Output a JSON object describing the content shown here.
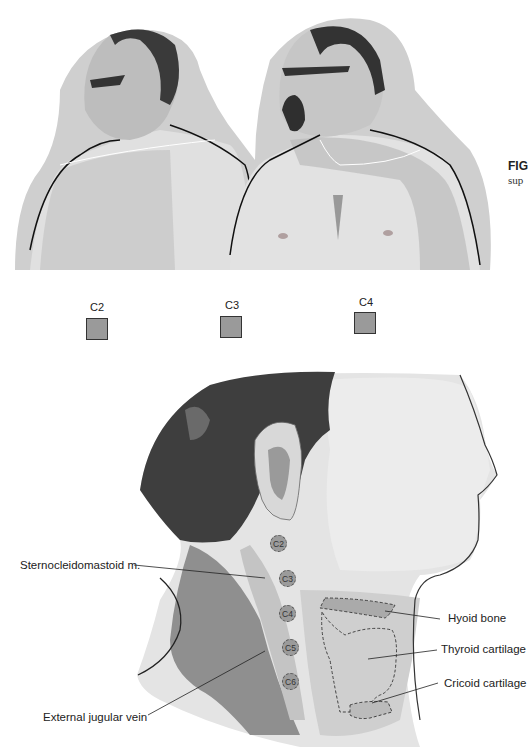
{
  "figure": {
    "caption_label": "FIG",
    "caption_text": "sup"
  },
  "top_illustration": {
    "description": "Two views of a bearded man with glasses showing dermatome shading of neck and shoulders",
    "swatches": [
      {
        "label": "C2",
        "color": "#9a9a9a"
      },
      {
        "label": "C3",
        "color": "#9a9a9a"
      },
      {
        "label": "C4",
        "color": "#9a9a9a"
      }
    ]
  },
  "bottom_illustration": {
    "description": "Lateral view of head and neck with cervical transverse process landmarks",
    "segments": [
      "C2",
      "C3",
      "C4",
      "C5",
      "C6"
    ],
    "labels": {
      "sternocleidomastoid": "Sternocleidomastoid m.",
      "external_jugular": "External jugular vein",
      "hyoid": "Hyoid bone",
      "thyroid": "Thyroid cartilage",
      "cricoid": "Cricoid cartilage"
    }
  },
  "colors": {
    "skin_light": "#e2e2e2",
    "skin_mid": "#bdbdbd",
    "shade_dark": "#8e8e8e",
    "hair": "#3a3a3a",
    "halo": "#cfcfcf"
  }
}
